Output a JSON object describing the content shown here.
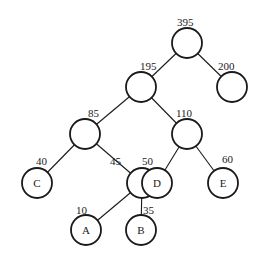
{
  "diagram": {
    "type": "huffman-tree",
    "nodes": [
      {
        "id": "n395",
        "weight": "395",
        "label": ""
      },
      {
        "id": "n195",
        "weight": "195",
        "label": ""
      },
      {
        "id": "n200",
        "weight": "200",
        "label": ""
      },
      {
        "id": "n85",
        "weight": "85",
        "label": ""
      },
      {
        "id": "n110",
        "weight": "110",
        "label": ""
      },
      {
        "id": "nC",
        "weight": "40",
        "label": "C"
      },
      {
        "id": "n45",
        "weight": "45",
        "label": ""
      },
      {
        "id": "nD",
        "weight": "50",
        "label": "D"
      },
      {
        "id": "nE",
        "weight": "60",
        "label": "E"
      },
      {
        "id": "nA",
        "weight": "10",
        "label": "A"
      },
      {
        "id": "nB",
        "weight": "35",
        "label": "B"
      }
    ],
    "edges": [
      [
        "n395",
        "n195"
      ],
      [
        "n395",
        "n200"
      ],
      [
        "n195",
        "n85"
      ],
      [
        "n195",
        "n110"
      ],
      [
        "n85",
        "nC"
      ],
      [
        "n85",
        "n45"
      ],
      [
        "n110",
        "nD"
      ],
      [
        "n110",
        "nE"
      ],
      [
        "n45",
        "nA"
      ],
      [
        "n45",
        "nB"
      ]
    ]
  }
}
